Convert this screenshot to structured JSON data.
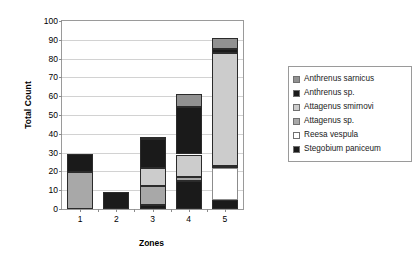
{
  "chart_data": {
    "type": "bar",
    "subtype": "stacked-bar",
    "title": "",
    "xlabel": "Zones",
    "ylabel": "Total Count",
    "categories": [
      "1",
      "2",
      "3",
      "4",
      "5"
    ],
    "ylim": [
      0,
      100
    ],
    "yticks": [
      0,
      10,
      20,
      30,
      40,
      50,
      60,
      70,
      80,
      90,
      100
    ],
    "grid": true,
    "legend_position": "right",
    "series": [
      {
        "name": "Stegobium paniceum",
        "color": "#1a1a1a",
        "values": [
          0,
          9,
          2,
          15,
          5
        ]
      },
      {
        "name": "Reesa vespula",
        "color": "#ffffff",
        "values": [
          0,
          0,
          0,
          0,
          17
        ]
      },
      {
        "name": "Attagenus sp.",
        "color": "#a8a8a8",
        "values": [
          19.5,
          0,
          10,
          2,
          1
        ]
      },
      {
        "name": "Attagenus smirnovi",
        "color": "#cccccc",
        "values": [
          0,
          0,
          10,
          12,
          60
        ]
      },
      {
        "name": "Anthrenus sp.",
        "color": "#1a1a1a",
        "values": [
          9.5,
          0,
          15.5,
          25,
          2
        ]
      },
      {
        "name": "Anthrenus sarnicus",
        "color": "#919191",
        "values": [
          0,
          0,
          0.5,
          7,
          6
        ]
      }
    ],
    "totals": [
      29,
      9,
      38,
      61,
      91
    ],
    "legend": [
      {
        "label": "Anthrenus sarnicus",
        "color": "#919191"
      },
      {
        "label": "Anthrenus sp.",
        "color": "#1a1a1a"
      },
      {
        "label": "Attagenus smirnovi",
        "color": "#cccccc"
      },
      {
        "label": "Attagenus sp.",
        "color": "#a8a8a8"
      },
      {
        "label": "Reesa vespula",
        "color": "#ffffff"
      },
      {
        "label": "Stegobium paniceum",
        "color": "#1a1a1a"
      }
    ]
  }
}
